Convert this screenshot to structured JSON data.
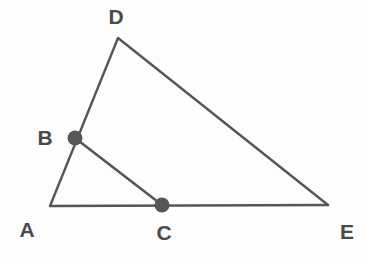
{
  "figure": {
    "background_color": "#fdfdfd",
    "stroke_color": "#565656",
    "point_color": "#575757",
    "label_color": "#4a4a4a",
    "width": 365,
    "height": 258,
    "points": [
      {
        "id": "A",
        "label": "A",
        "x": 50,
        "y": 206,
        "marked": false,
        "label_x": 27,
        "label_y": 237
      },
      {
        "id": "B",
        "label": "B",
        "x": 75,
        "y": 138,
        "marked": true,
        "label_x": 45,
        "label_y": 145
      },
      {
        "id": "C",
        "label": "C",
        "x": 162,
        "y": 205,
        "marked": true,
        "label_x": 164,
        "label_y": 240
      },
      {
        "id": "D",
        "label": "D",
        "x": 118,
        "y": 38,
        "marked": false,
        "label_x": 116,
        "label_y": 24
      },
      {
        "id": "E",
        "label": "E",
        "x": 328,
        "y": 205,
        "marked": false,
        "label_x": 347,
        "label_y": 239
      }
    ],
    "segments": [
      {
        "id": "AD",
        "from": "A",
        "to": "D",
        "kind": "edge",
        "x1": 50,
        "y1": 206,
        "x2": 118,
        "y2": 38
      },
      {
        "id": "DE",
        "from": "D",
        "to": "E",
        "kind": "edge",
        "x1": 118,
        "y1": 38,
        "x2": 328,
        "y2": 205
      },
      {
        "id": "AE",
        "from": "A",
        "to": "E",
        "kind": "edge",
        "x1": 50,
        "y1": 206,
        "x2": 328,
        "y2": 205
      },
      {
        "id": "BC",
        "from": "B",
        "to": "C",
        "kind": "cevian",
        "x1": 75,
        "y1": 138,
        "x2": 162,
        "y2": 205
      }
    ],
    "point_radius": 7.5
  }
}
